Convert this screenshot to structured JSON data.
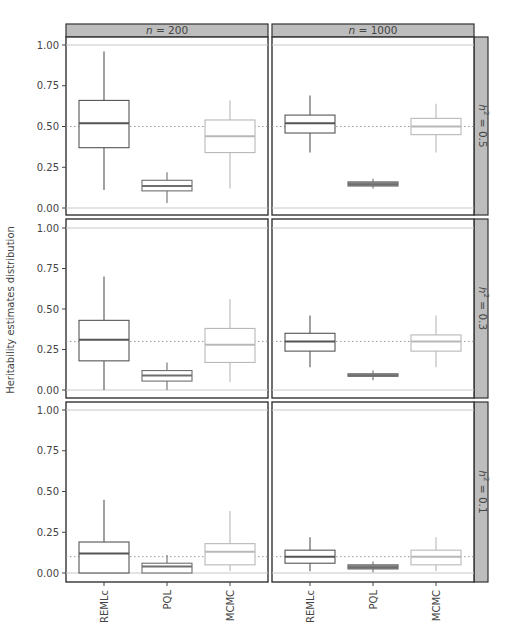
{
  "chart_data": {
    "type": "box",
    "ylabel": "Heritability estimates distribution",
    "xlabel": "",
    "ylim": [
      0,
      1
    ],
    "yticks": [
      "0.00",
      "0.25",
      "0.50",
      "0.75",
      "1.00"
    ],
    "categories": [
      "REMLc",
      "PQL",
      "MCMC"
    ],
    "category_colors": {
      "REMLc": "#555555",
      "PQL": "#6e6e6e",
      "MCMC": "#b8b8b8"
    },
    "columns": [
      {
        "label_prefix": "n",
        "label_value": "= 200"
      },
      {
        "label_prefix": "n",
        "label_value": "= 1000"
      }
    ],
    "rows": [
      {
        "label_prefix": "h",
        "label_sup": "2",
        "label_value": "= 0.5",
        "true_value": 0.5
      },
      {
        "label_prefix": "h",
        "label_sup": "2",
        "label_value": "= 0.3",
        "true_value": 0.3
      },
      {
        "label_prefix": "h",
        "label_sup": "2",
        "label_value": "= 0.1",
        "true_value": 0.1
      }
    ],
    "grid": "horizontal lines at 0 and 1; dotted reference line at true h2",
    "panels": [
      {
        "row": 0,
        "col": 0,
        "boxes": [
          {
            "method": "REMLc",
            "min": 0.11,
            "q1": 0.37,
            "median": 0.52,
            "q3": 0.66,
            "max": 0.96
          },
          {
            "method": "PQL",
            "min": 0.03,
            "q1": 0.105,
            "median": 0.135,
            "q3": 0.17,
            "max": 0.22
          },
          {
            "method": "MCMC",
            "min": 0.12,
            "q1": 0.34,
            "median": 0.44,
            "q3": 0.54,
            "max": 0.66
          }
        ]
      },
      {
        "row": 0,
        "col": 1,
        "boxes": [
          {
            "method": "REMLc",
            "min": 0.34,
            "q1": 0.46,
            "median": 0.52,
            "q3": 0.57,
            "max": 0.69
          },
          {
            "method": "PQL",
            "min": 0.12,
            "q1": 0.135,
            "median": 0.145,
            "q3": 0.16,
            "max": 0.18
          },
          {
            "method": "MCMC",
            "min": 0.34,
            "q1": 0.45,
            "median": 0.5,
            "q3": 0.55,
            "max": 0.64
          }
        ]
      },
      {
        "row": 1,
        "col": 0,
        "boxes": [
          {
            "method": "REMLc",
            "min": 0.0,
            "q1": 0.18,
            "median": 0.31,
            "q3": 0.43,
            "max": 0.7
          },
          {
            "method": "PQL",
            "min": 0.0,
            "q1": 0.055,
            "median": 0.09,
            "q3": 0.12,
            "max": 0.17
          },
          {
            "method": "MCMC",
            "min": 0.05,
            "q1": 0.17,
            "median": 0.28,
            "q3": 0.38,
            "max": 0.56
          }
        ]
      },
      {
        "row": 1,
        "col": 1,
        "boxes": [
          {
            "method": "REMLc",
            "min": 0.14,
            "q1": 0.24,
            "median": 0.3,
            "q3": 0.35,
            "max": 0.46
          },
          {
            "method": "PQL",
            "min": 0.06,
            "q1": 0.085,
            "median": 0.09,
            "q3": 0.1,
            "max": 0.12
          },
          {
            "method": "MCMC",
            "min": 0.14,
            "q1": 0.24,
            "median": 0.3,
            "q3": 0.34,
            "max": 0.46
          }
        ]
      },
      {
        "row": 2,
        "col": 0,
        "boxes": [
          {
            "method": "REMLc",
            "min": 0.0,
            "q1": 0.0,
            "median": 0.12,
            "q3": 0.19,
            "max": 0.45
          },
          {
            "method": "PQL",
            "min": 0.0,
            "q1": 0.0,
            "median": 0.04,
            "q3": 0.06,
            "max": 0.11
          },
          {
            "method": "MCMC",
            "min": 0.01,
            "q1": 0.05,
            "median": 0.13,
            "q3": 0.18,
            "max": 0.38
          }
        ]
      },
      {
        "row": 2,
        "col": 1,
        "boxes": [
          {
            "method": "REMLc",
            "min": 0.01,
            "q1": 0.06,
            "median": 0.1,
            "q3": 0.14,
            "max": 0.22
          },
          {
            "method": "PQL",
            "min": 0.005,
            "q1": 0.025,
            "median": 0.035,
            "q3": 0.05,
            "max": 0.07
          },
          {
            "method": "MCMC",
            "min": 0.01,
            "q1": 0.05,
            "median": 0.1,
            "q3": 0.14,
            "max": 0.22
          }
        ]
      }
    ]
  },
  "colors": {
    "strip_fill": "#bdbdbd",
    "panel_border": "#333333",
    "ref_line": "#999999",
    "limit_line": "#c8c8c8",
    "axis_text": "#555555"
  }
}
